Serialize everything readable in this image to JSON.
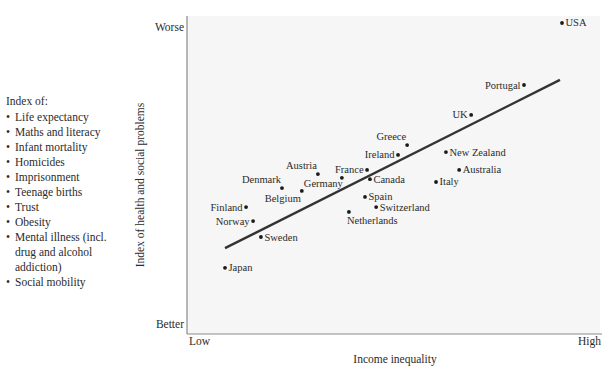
{
  "legend": {
    "title": "Index of:",
    "items": [
      "Life expectancy",
      "Maths and literacy",
      "Infant mortality",
      "Homicides",
      "Imprisonment",
      "Teenage births",
      "Trust",
      "Obesity",
      "Mental illness (incl. drug and alcohol addiction)",
      "Social mobility"
    ]
  },
  "chart_data": {
    "type": "scatter",
    "title": "",
    "xlabel": "Income inequality",
    "ylabel": "Index of health and social problems",
    "x_ticks": [
      "Low",
      "High"
    ],
    "y_ticks": [
      "Better",
      "Worse"
    ],
    "xlim": [
      0,
      100
    ],
    "ylim": [
      0,
      100
    ],
    "grid": false,
    "legend_position": "left",
    "colors": {
      "plot_background": "#f6f6f6",
      "points": "#1a1a1a",
      "fit_line": "#333333",
      "axis": "#8a8a8a"
    },
    "points": [
      {
        "label": "USA",
        "x": 90.8,
        "y": 97.8,
        "label_pos": "right"
      },
      {
        "label": "Portugal",
        "x": 81.6,
        "y": 78.3,
        "label_pos": "left"
      },
      {
        "label": "UK",
        "x": 68.8,
        "y": 68.9,
        "label_pos": "left"
      },
      {
        "label": "Greece",
        "x": 53.3,
        "y": 59.4,
        "label_pos": "above-left"
      },
      {
        "label": "Ireland",
        "x": 51.1,
        "y": 56.3,
        "label_pos": "left"
      },
      {
        "label": "New Zealand",
        "x": 62.7,
        "y": 57.2,
        "label_pos": "right"
      },
      {
        "label": "France",
        "x": 43.6,
        "y": 51.6,
        "label_pos": "left"
      },
      {
        "label": "Australia",
        "x": 65.9,
        "y": 51.6,
        "label_pos": "right"
      },
      {
        "label": "Austria",
        "x": 31.7,
        "y": 50.3,
        "label_pos": "above-left"
      },
      {
        "label": "Canada",
        "x": 44.3,
        "y": 48.7,
        "label_pos": "right"
      },
      {
        "label": "Germany",
        "x": 37.5,
        "y": 49.1,
        "label_pos": "below-left"
      },
      {
        "label": "Italy",
        "x": 60.3,
        "y": 47.8,
        "label_pos": "right"
      },
      {
        "label": "Denmark",
        "x": 23.0,
        "y": 45.9,
        "label_pos": "above-left"
      },
      {
        "label": "Belgium",
        "x": 27.8,
        "y": 45.0,
        "label_pos": "below-left"
      },
      {
        "label": "Spain",
        "x": 43.1,
        "y": 43.1,
        "label_pos": "right"
      },
      {
        "label": "Finland",
        "x": 14.3,
        "y": 39.9,
        "label_pos": "left"
      },
      {
        "label": "Switzerland",
        "x": 45.8,
        "y": 39.9,
        "label_pos": "right"
      },
      {
        "label": "Netherlands",
        "x": 39.2,
        "y": 38.4,
        "label_pos": "below"
      },
      {
        "label": "Norway",
        "x": 16.0,
        "y": 35.5,
        "label_pos": "left"
      },
      {
        "label": "Sweden",
        "x": 17.9,
        "y": 30.5,
        "label_pos": "right"
      },
      {
        "label": "Japan",
        "x": 9.2,
        "y": 20.8,
        "label_pos": "right"
      }
    ],
    "fit_line": {
      "x": [
        9.2,
        90.3
      ],
      "y": [
        27.0,
        79.9
      ]
    }
  }
}
